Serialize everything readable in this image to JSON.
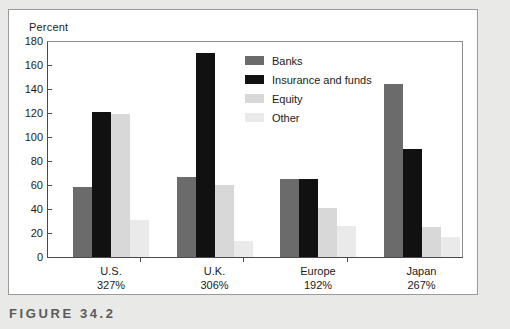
{
  "figure": {
    "caption": "FIGURE 34.2"
  },
  "chart_data": {
    "type": "bar",
    "title": "",
    "subtitle": "",
    "xlabel": "",
    "ylabel": "Percent",
    "ylim": [
      0,
      180
    ],
    "ytick_step": 20,
    "yticks": [
      "180",
      "160",
      "140",
      "120",
      "100",
      "80",
      "60",
      "40",
      "20",
      "0"
    ],
    "grid": false,
    "legend_position": "inside-top-center",
    "categories": [
      "U.S.",
      "U.K.",
      "Europe",
      "Japan"
    ],
    "category_sublabels": [
      "327%",
      "306%",
      "192%",
      "267%"
    ],
    "series": [
      {
        "name": "Banks",
        "color": "#6b6b6b",
        "values": [
          58,
          67,
          65,
          144
        ]
      },
      {
        "name": "Insurance and funds",
        "color": "#111111",
        "values": [
          121,
          170,
          65,
          90
        ]
      },
      {
        "name": "Equity",
        "color": "#d8d8d8",
        "values": [
          119,
          60,
          41,
          25
        ]
      },
      {
        "name": "Other",
        "color": "#eaeaea",
        "values": [
          31,
          13,
          26,
          17
        ]
      }
    ]
  }
}
